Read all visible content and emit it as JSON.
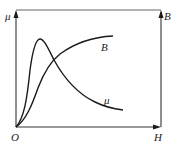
{
  "diagram": {
    "type": "magnetization-permeability-curves",
    "axes": {
      "left_y_label": "μ",
      "right_y_label": "B",
      "x_label": "H",
      "origin_label": "O"
    },
    "curves": [
      {
        "name": "B",
        "label": "B",
        "description": "magnetization curve, S-shaped rising to saturation"
      },
      {
        "name": "mu",
        "label": "μ",
        "description": "permeability curve, sharp peak then decay"
      }
    ],
    "colors": {
      "line": "#1a1a1a",
      "frame": "#555555",
      "background": "#ffffff"
    }
  }
}
